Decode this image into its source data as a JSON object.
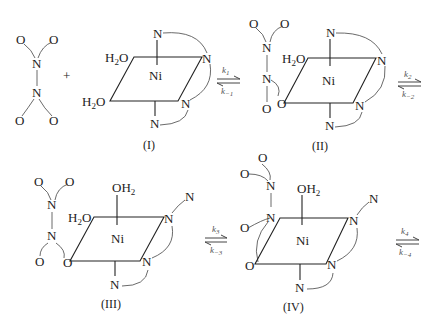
{
  "diagram": {
    "type": "reaction-scheme",
    "reactant": {
      "name": "N2O4",
      "atoms": [
        "O",
        "O",
        "N",
        "N",
        "O",
        "O"
      ]
    },
    "plus_sign": "+",
    "complexes": [
      {
        "label": "(I)",
        "metal": "Ni",
        "ligands": {
          "h2o_top": "H2O",
          "h2o_bottom": "H2O",
          "n_top": "N",
          "n_right_top": "N",
          "n_right_bottom": "N",
          "n_bottom": "N"
        }
      },
      {
        "label": "(II)",
        "metal": "Ni",
        "ligands": {
          "h2o_top": "H2O",
          "o_bound": "O",
          "n_top": "N",
          "n_right_top": "N",
          "n_right_bottom": "N",
          "n_bottom": "N"
        },
        "n2o4_atoms": [
          "O",
          "O",
          "N",
          "N",
          "O"
        ]
      },
      {
        "label": "(III)",
        "metal": "Ni",
        "ligands": {
          "oh2_axial": "OH2",
          "h2o_top": "H2O",
          "o_bound": "O",
          "n_dangling": "N",
          "n_right_top": "N",
          "n_right_bottom": "N",
          "n_bottom": "N"
        },
        "n2o4_atoms": [
          "O",
          "O",
          "N",
          "N",
          "O"
        ]
      },
      {
        "label": "(IV)",
        "metal": "Ni",
        "ligands": {
          "oh2_axial": "OH2",
          "n_bound": "N",
          "o_bound": "O",
          "n_dangling": "N",
          "n_right_top": "N",
          "n_right_bottom": "N",
          "n_bottom": "N"
        },
        "n2o4_atoms": [
          "O",
          "O",
          "N",
          "O"
        ]
      }
    ],
    "equilibria": [
      {
        "forward": "k",
        "forward_sub": "1",
        "reverse": "k",
        "reverse_sub": "−1"
      },
      {
        "forward": "k",
        "forward_sub": "2",
        "reverse": "k",
        "reverse_sub": "−2"
      },
      {
        "forward": "k",
        "forward_sub": "3",
        "reverse": "k",
        "reverse_sub": "−3"
      },
      {
        "forward": "k",
        "forward_sub": "4",
        "reverse": "k",
        "reverse_sub": "−4"
      }
    ],
    "text": {
      "O": "O",
      "N": "N",
      "Ni": "Ni",
      "H": "H",
      "two": "2",
      "OH": "OH",
      "plus": "+"
    }
  }
}
